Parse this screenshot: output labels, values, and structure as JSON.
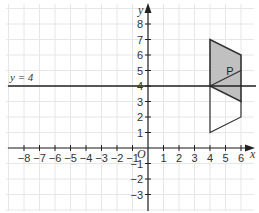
{
  "diagram": {
    "type": "coordinate-grid",
    "axes": {
      "x_label": "x",
      "y_label": "y",
      "origin_label": "O",
      "x_ticks": [
        "−8",
        "−7",
        "−6",
        "−5",
        "−4",
        "−3",
        "−2",
        "−1",
        "1",
        "2",
        "3",
        "4",
        "5",
        "6"
      ],
      "x_tick_values": [
        -8,
        -7,
        -6,
        -5,
        -4,
        -3,
        -2,
        -1,
        1,
        2,
        3,
        4,
        5,
        6
      ],
      "y_ticks": [
        "8",
        "7",
        "6",
        "5",
        "4",
        "3",
        "2",
        "1",
        "−1",
        "−2",
        "−3"
      ],
      "y_tick_values": [
        8,
        7,
        6,
        5,
        4,
        3,
        2,
        1,
        -1,
        -2,
        -3
      ]
    },
    "mirror_line": {
      "label": "y = 4",
      "equation_y": 4
    },
    "shape_P": {
      "label": "P",
      "vertices": [
        [
          4,
          4
        ],
        [
          4,
          7
        ],
        [
          6,
          6
        ],
        [
          6,
          3
        ]
      ],
      "inner_line": [
        [
          4,
          4
        ],
        [
          6,
          5
        ]
      ],
      "fill": "#c0c0c0"
    },
    "image_outline": {
      "vertices": [
        [
          4,
          4
        ],
        [
          4,
          1
        ],
        [
          6,
          2
        ],
        [
          6,
          3
        ]
      ],
      "note_visible": "open outline below y = 4"
    },
    "colors": {
      "grid": "#e4e4e4",
      "axis": "#222222",
      "shape_fill": "#c0c0c0",
      "shape_stroke": "#333333"
    }
  }
}
